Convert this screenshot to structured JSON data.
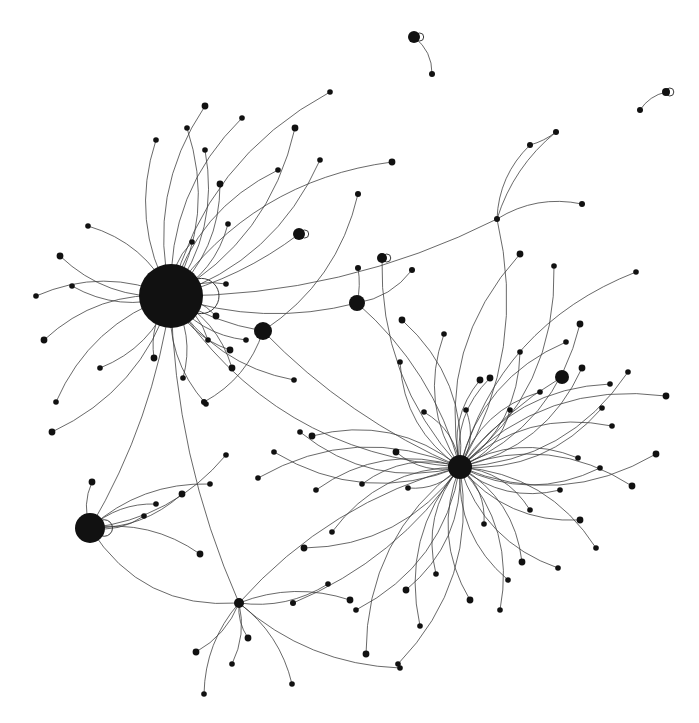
{
  "diagram": {
    "type": "network-graph",
    "background": "#ffffff",
    "node_color": "#111111",
    "edge_color": "#3a3a3a",
    "hubs": [
      {
        "id": "H1",
        "x": 171,
        "y": 296,
        "r": 32,
        "loop": true
      },
      {
        "id": "H2",
        "x": 460,
        "y": 467,
        "r": 12,
        "loop": false
      },
      {
        "id": "H3",
        "x": 90,
        "y": 528,
        "r": 15,
        "loop": true
      },
      {
        "id": "H4",
        "x": 263,
        "y": 331,
        "r": 9,
        "loop": false
      },
      {
        "id": "H5",
        "x": 357,
        "y": 303,
        "r": 8,
        "loop": false
      },
      {
        "id": "H6",
        "x": 562,
        "y": 377,
        "r": 7,
        "loop": false
      },
      {
        "id": "H7",
        "x": 299,
        "y": 234,
        "r": 6,
        "loop": true
      },
      {
        "id": "H8",
        "x": 382,
        "y": 258,
        "r": 5,
        "loop": true
      },
      {
        "id": "H9",
        "x": 414,
        "y": 37,
        "r": 6,
        "loop": true
      },
      {
        "id": "H10",
        "x": 239,
        "y": 603,
        "r": 5,
        "loop": false
      },
      {
        "id": "H11",
        "x": 666,
        "y": 92,
        "r": 4,
        "loop": true
      },
      {
        "id": "H12",
        "x": 497,
        "y": 219,
        "r": 3,
        "loop": false
      },
      {
        "id": "H13",
        "x": 293,
        "y": 603,
        "r": 3,
        "loop": false
      }
    ],
    "satellites_H1": [
      [
        205,
        106
      ],
      [
        187,
        128
      ],
      [
        242,
        118
      ],
      [
        295,
        128
      ],
      [
        330,
        92
      ],
      [
        320,
        160
      ],
      [
        392,
        162
      ],
      [
        205,
        150
      ],
      [
        278,
        170
      ],
      [
        220,
        184
      ],
      [
        156,
        140
      ],
      [
        88,
        226
      ],
      [
        60,
        256
      ],
      [
        36,
        296
      ],
      [
        72,
        286
      ],
      [
        44,
        340
      ],
      [
        100,
        368
      ],
      [
        56,
        402
      ],
      [
        52,
        432
      ],
      [
        228,
        224
      ],
      [
        192,
        242
      ],
      [
        154,
        358
      ],
      [
        183,
        378
      ],
      [
        206,
        404
      ],
      [
        232,
        368
      ],
      [
        246,
        340
      ],
      [
        226,
        284
      ],
      [
        230,
        350
      ],
      [
        208,
        340
      ],
      [
        294,
        380
      ],
      [
        216,
        316
      ]
    ],
    "satellites_H2": [
      [
        520,
        254
      ],
      [
        554,
        266
      ],
      [
        636,
        272
      ],
      [
        580,
        324
      ],
      [
        566,
        342
      ],
      [
        520,
        352
      ],
      [
        480,
        380
      ],
      [
        424,
        412
      ],
      [
        400,
        362
      ],
      [
        402,
        320
      ],
      [
        444,
        334
      ],
      [
        466,
        410
      ],
      [
        490,
        378
      ],
      [
        510,
        410
      ],
      [
        540,
        392
      ],
      [
        582,
        368
      ],
      [
        610,
        384
      ],
      [
        628,
        372
      ],
      [
        666,
        396
      ],
      [
        602,
        408
      ],
      [
        612,
        426
      ],
      [
        656,
        454
      ],
      [
        578,
        458
      ],
      [
        600,
        468
      ],
      [
        632,
        486
      ],
      [
        560,
        490
      ],
      [
        530,
        510
      ],
      [
        580,
        520
      ],
      [
        596,
        548
      ],
      [
        558,
        568
      ],
      [
        522,
        562
      ],
      [
        508,
        580
      ],
      [
        500,
        610
      ],
      [
        470,
        600
      ],
      [
        484,
        524
      ],
      [
        436,
        574
      ],
      [
        406,
        590
      ],
      [
        420,
        626
      ],
      [
        398,
        664
      ],
      [
        366,
        654
      ],
      [
        356,
        610
      ],
      [
        332,
        532
      ],
      [
        304,
        548
      ],
      [
        316,
        490
      ],
      [
        300,
        432
      ],
      [
        312,
        436
      ],
      [
        274,
        452
      ],
      [
        258,
        478
      ],
      [
        396,
        452
      ],
      [
        362,
        484
      ],
      [
        408,
        488
      ]
    ],
    "satellites_H3": [
      [
        92,
        482
      ],
      [
        144,
        516
      ],
      [
        156,
        504
      ],
      [
        182,
        494
      ],
      [
        210,
        484
      ],
      [
        226,
        455
      ],
      [
        200,
        554
      ]
    ],
    "satellites_H10": [
      [
        196,
        652
      ],
      [
        204,
        694
      ],
      [
        232,
        664
      ],
      [
        248,
        638
      ],
      [
        292,
        684
      ],
      [
        328,
        584
      ],
      [
        350,
        600
      ],
      [
        400,
        668
      ]
    ],
    "satellites_misc": [
      [
        432,
        74
      ],
      [
        640,
        110
      ],
      [
        530,
        145
      ],
      [
        556,
        132
      ],
      [
        582,
        204
      ],
      [
        358,
        194
      ],
      [
        358,
        268
      ],
      [
        412,
        270
      ],
      [
        204,
        402
      ]
    ]
  }
}
